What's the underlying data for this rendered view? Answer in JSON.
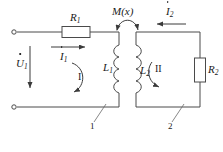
{
  "diagram": {
    "stroke_color": "#4a4a4a",
    "text_color": "#1a1a1a",
    "background": "#ffffff"
  },
  "labels": {
    "source_voltage": {
      "symbol": "U",
      "subscript": "1",
      "dot": true
    },
    "resistor_1": {
      "symbol": "R",
      "subscript": "1"
    },
    "resistor_2": {
      "symbol": "R",
      "subscript": "2"
    },
    "inductor_1": {
      "symbol": "L",
      "subscript": "1"
    },
    "inductor_2": {
      "symbol": "L",
      "subscript": "2"
    },
    "current_1": {
      "symbol": "I",
      "subscript": "1",
      "dot": true
    },
    "current_2": {
      "symbol": "I",
      "subscript": "2",
      "dot": true
    },
    "mutual_inductance": "M(x)",
    "loop_1": "I",
    "loop_2": "II",
    "mesh_marker_1": "1",
    "mesh_marker_2": "2"
  },
  "components": [
    {
      "name": "resistor-r1",
      "type": "resistor",
      "orientation": "horizontal",
      "label": "R1"
    },
    {
      "name": "resistor-r2",
      "type": "resistor",
      "orientation": "vertical",
      "label": "R2"
    },
    {
      "name": "inductor-l1",
      "type": "coil",
      "orientation": "vertical",
      "label": "L1",
      "turns": 4
    },
    {
      "name": "inductor-l2",
      "type": "coil",
      "orientation": "vertical",
      "label": "L2",
      "turns": 4
    },
    {
      "name": "terminal-top",
      "type": "open-terminal"
    },
    {
      "name": "terminal-bottom",
      "type": "open-terminal"
    },
    {
      "name": "mutual-coupling-arc",
      "type": "double-arrow-arc",
      "label": "M(x)"
    }
  ],
  "arrows": {
    "source_voltage_direction": "down",
    "current_1_direction": "right",
    "current_2_direction": "left",
    "loop_1_direction": "clockwise",
    "loop_2_direction": "clockwise"
  }
}
